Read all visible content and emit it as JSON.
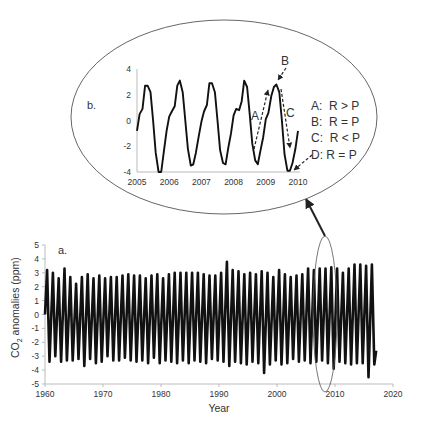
{
  "figure": {
    "panel_a_label": "a.",
    "panel_b_label": "b.",
    "ylabel_main": "CO",
    "ylabel_sub": "2",
    "ylabel_rest": " anomalies (ppm)",
    "xlabel": "Year"
  },
  "chart_data": [
    {
      "type": "line",
      "title": "a.",
      "xlabel": "Year",
      "ylabel": "CO2 anomalies (ppm)",
      "xlim": [
        1960,
        2020
      ],
      "ylim": [
        -5,
        5
      ],
      "xticks": [
        "1960",
        "1970",
        "1980",
        "1990",
        "2000",
        "2010",
        "2020"
      ],
      "yticks": [
        "5",
        "4",
        "3",
        "2",
        "1",
        "0",
        "-1",
        "-2",
        "-3",
        "-4",
        "-5"
      ],
      "grid": false,
      "series": [
        {
          "name": "CO2 seasonal anomaly",
          "x_start": 1960,
          "x_end": 2017.1,
          "annual_peaks": [
            3.2,
            3.0,
            2.6,
            3.3,
            2.7,
            2.2,
            2.7,
            2.9,
            2.6,
            2.8,
            2.6,
            2.7,
            2.7,
            2.8,
            2.9,
            2.8,
            2.8,
            2.6,
            2.8,
            2.9,
            2.6,
            2.9,
            3.0,
            3.0,
            3.0,
            3.0,
            3.0,
            2.9,
            2.8,
            2.8,
            3.0,
            3.8,
            3.2,
            3.1,
            2.9,
            3.0,
            2.9,
            3.1,
            3.0,
            2.7,
            3.2,
            2.9,
            2.7,
            2.8,
            2.9,
            3.3,
            3.2,
            3.3,
            3.3,
            3.4,
            3.3,
            3.0,
            3.3,
            3.6,
            3.6,
            3.5,
            3.6
          ],
          "annual_troughs": [
            -3.4,
            -3.0,
            -3.4,
            -3.3,
            -3.3,
            -3.2,
            -3.7,
            -3.2,
            -3.5,
            -3.4,
            -3.0,
            -3.3,
            -3.3,
            -3.1,
            -3.3,
            -3.4,
            -3.3,
            -3.5,
            -3.1,
            -3.5,
            -3.3,
            -3.4,
            -3.5,
            -3.3,
            -3.5,
            -3.3,
            -3.4,
            -3.5,
            -3.2,
            -3.3,
            -3.4,
            -3.7,
            -3.4,
            -3.5,
            -3.6,
            -3.4,
            -3.5,
            -4.2,
            -3.6,
            -3.3,
            -3.6,
            -3.5,
            -3.2,
            -3.4,
            -3.3,
            -3.5,
            -3.4,
            -3.3,
            -3.5,
            -3.9,
            -3.4,
            -3.5,
            -3.6,
            -3.5,
            -3.5,
            -4.5,
            -3.6
          ]
        }
      ]
    },
    {
      "type": "line",
      "title": "b.",
      "xlim": [
        2005,
        2010
      ],
      "ylim": [
        -4,
        4
      ],
      "xticks": [
        "2005",
        "2006",
        "2007",
        "2008",
        "2009",
        "2010"
      ],
      "yticks": [
        "4",
        "2",
        "0",
        "-2",
        "-4"
      ],
      "grid": false,
      "series": [
        {
          "name": "CO2 seasonal anomaly 2005-2010",
          "x": [
            2005.0,
            2005.08,
            2005.17,
            2005.25,
            2005.33,
            2005.42,
            2005.5,
            2005.58,
            2005.67,
            2005.75,
            2005.83,
            2005.92,
            2006.0,
            2006.08,
            2006.17,
            2006.25,
            2006.33,
            2006.42,
            2006.5,
            2006.58,
            2006.67,
            2006.75,
            2006.83,
            2006.92,
            2007.0,
            2007.08,
            2007.17,
            2007.25,
            2007.33,
            2007.42,
            2007.5,
            2007.58,
            2007.67,
            2007.75,
            2007.83,
            2007.92,
            2008.0,
            2008.08,
            2008.17,
            2008.25,
            2008.33,
            2008.42,
            2008.5,
            2008.58,
            2008.67,
            2008.75,
            2008.83,
            2008.92,
            2009.0,
            2009.08,
            2009.17,
            2009.25,
            2009.33,
            2009.42,
            2009.5,
            2009.58,
            2009.67,
            2009.75,
            2009.83,
            2009.92,
            2010.0
          ],
          "y": [
            -0.8,
            0.5,
            0.9,
            2.7,
            2.7,
            2.2,
            0.0,
            -2.5,
            -4.0,
            -4.0,
            -2.5,
            -0.8,
            0.3,
            0.7,
            1.1,
            2.7,
            3.1,
            2.2,
            0.0,
            -2.2,
            -3.5,
            -3.4,
            -2.5,
            -1.2,
            -0.1,
            0.7,
            1.2,
            2.9,
            2.9,
            2.2,
            0.0,
            -2.3,
            -3.3,
            -3.4,
            -2.2,
            -1.0,
            0.4,
            0.9,
            0.8,
            1.5,
            3.1,
            2.6,
            0.5,
            -1.8,
            -3.1,
            -3.4,
            -2.4,
            -1.3,
            0.1,
            0.6,
            1.9,
            2.6,
            2.8,
            2.2,
            0.0,
            -2.6,
            -3.9,
            -3.9,
            -3.3,
            -2.2,
            -0.8
          ]
        }
      ],
      "annotations": [
        {
          "label": "A",
          "text": "A:  R > P"
        },
        {
          "label": "B",
          "text": "B:  R = P"
        },
        {
          "label": "C",
          "text": "C:  R < P"
        },
        {
          "label": "D",
          "text": "D: R = P"
        }
      ]
    }
  ]
}
